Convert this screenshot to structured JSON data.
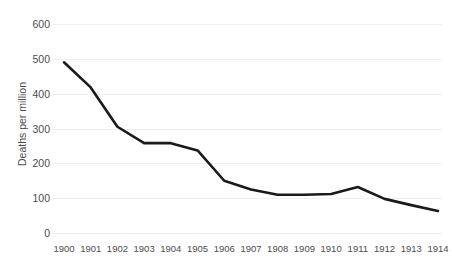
{
  "chart_data": {
    "type": "line",
    "title": "",
    "xlabel": "",
    "ylabel": "Deaths per million",
    "categories": [
      "1900",
      "1901",
      "1902",
      "1903",
      "1904",
      "1905",
      "1906",
      "1907",
      "1908",
      "1909",
      "1910",
      "1911",
      "1912",
      "1913",
      "1914"
    ],
    "values": [
      490,
      418,
      305,
      258,
      258,
      237,
      150,
      125,
      110,
      110,
      112,
      132,
      98,
      80,
      63
    ],
    "series": [
      {
        "name": "Deaths per million",
        "values": [
          490,
          418,
          305,
          258,
          258,
          237,
          150,
          125,
          110,
          110,
          112,
          132,
          98,
          80,
          63
        ]
      }
    ],
    "ylim": [
      0,
      600
    ],
    "yticks": [
      0,
      100,
      200,
      300,
      400,
      500,
      600
    ],
    "ytick_labels": [
      "0",
      "100",
      "200",
      "300",
      "400",
      "500",
      "600"
    ],
    "grid": "horizontal",
    "legend": "none",
    "line_color": "#1a1a1a",
    "grid_color": "#f0f0f0",
    "text_color": "#4d4d4d",
    "background": "#ffffff"
  }
}
